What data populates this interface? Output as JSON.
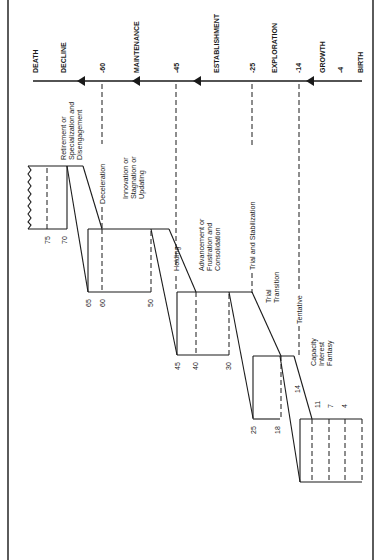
{
  "diagram": {
    "orientation": "rotated 90 degrees",
    "axis": {
      "stage_labels": [
        "DEATH",
        "DECLINE",
        "MAINTENANCE",
        "ESTABLISHMENT",
        "EXPLORATION",
        "GROWTH",
        "BIRTH"
      ],
      "age_markers": [
        "-60",
        "-45",
        "-25",
        "-14",
        "-4"
      ]
    },
    "labels": {
      "death": "DEATH",
      "decline": "DECLINE",
      "maintenance": "MAINTENANCE",
      "establishment": "ESTABLISHMENT",
      "exploration": "EXPLORATION",
      "growth": "GROWTH",
      "birth": "BIRTH",
      "age_60": "-60",
      "age_45": "-45",
      "age_25": "-25",
      "age_14": "-14",
      "age_4": "-4"
    },
    "substages": {
      "retirement_1": "Retirement or",
      "retirement_2": "Specialization and",
      "retirement_3": "Disengagement",
      "deceleration": "Deceleration",
      "innovation_1": "Innovation or",
      "innovation_2": "Stagnation or",
      "innovation_3": "Updating",
      "holding": "Holding",
      "advancement_1": "Advancement or",
      "advancement_2": "Frustration and",
      "advancement_3": "Consolidation",
      "trial_stabilization": "Trial and Stabilization",
      "trial_1": "Trial",
      "trial_2": "Transition",
      "tentative": "Tentative",
      "capacity": "Capacity",
      "interest": "Interest",
      "fantasy": "Fantasy"
    },
    "step_ages": {
      "a75": "75",
      "a70": "70",
      "a65": "65",
      "a60": "60",
      "a50": "50",
      "a45": "45",
      "a40": "40",
      "a30": "30",
      "a25": "25",
      "a18": "18",
      "a14": "14",
      "a11": "11",
      "a7": "7",
      "a4": "4"
    },
    "colors": {
      "ink": "#1a1a1a",
      "background": "#ffffff"
    }
  }
}
